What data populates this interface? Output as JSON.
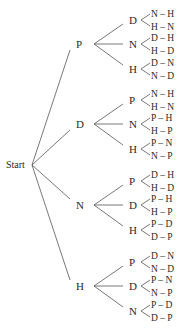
{
  "root": {
    "label": "Start"
  },
  "branches": [
    {
      "label": "P",
      "children": [
        {
          "label": "D",
          "outcomes": [
            "N – H",
            "H – N"
          ]
        },
        {
          "label": "N",
          "outcomes": [
            "D – H",
            "H – D"
          ]
        },
        {
          "label": "H",
          "outcomes": [
            "D – N",
            "N – D"
          ]
        }
      ]
    },
    {
      "label": "D",
      "children": [
        {
          "label": "P",
          "outcomes": [
            "N – H",
            "H – N"
          ]
        },
        {
          "label": "N",
          "outcomes": [
            "P – H",
            "H – P"
          ]
        },
        {
          "label": "H",
          "outcomes": [
            "P – N",
            "N – P"
          ]
        }
      ]
    },
    {
      "label": "N",
      "children": [
        {
          "label": "P",
          "outcomes": [
            "D – H",
            "H – D"
          ]
        },
        {
          "label": "D",
          "outcomes": [
            "P – H",
            "H – P"
          ]
        },
        {
          "label": "H",
          "outcomes": [
            "P – D",
            "D – P"
          ]
        }
      ]
    },
    {
      "label": "H",
      "children": [
        {
          "label": "P",
          "outcomes": [
            "D – N",
            "N – D"
          ]
        },
        {
          "label": "D",
          "outcomes": [
            "P – N",
            "N – P"
          ]
        },
        {
          "label": "N",
          "outcomes": [
            "P – D",
            "D – P"
          ]
        }
      ]
    }
  ]
}
